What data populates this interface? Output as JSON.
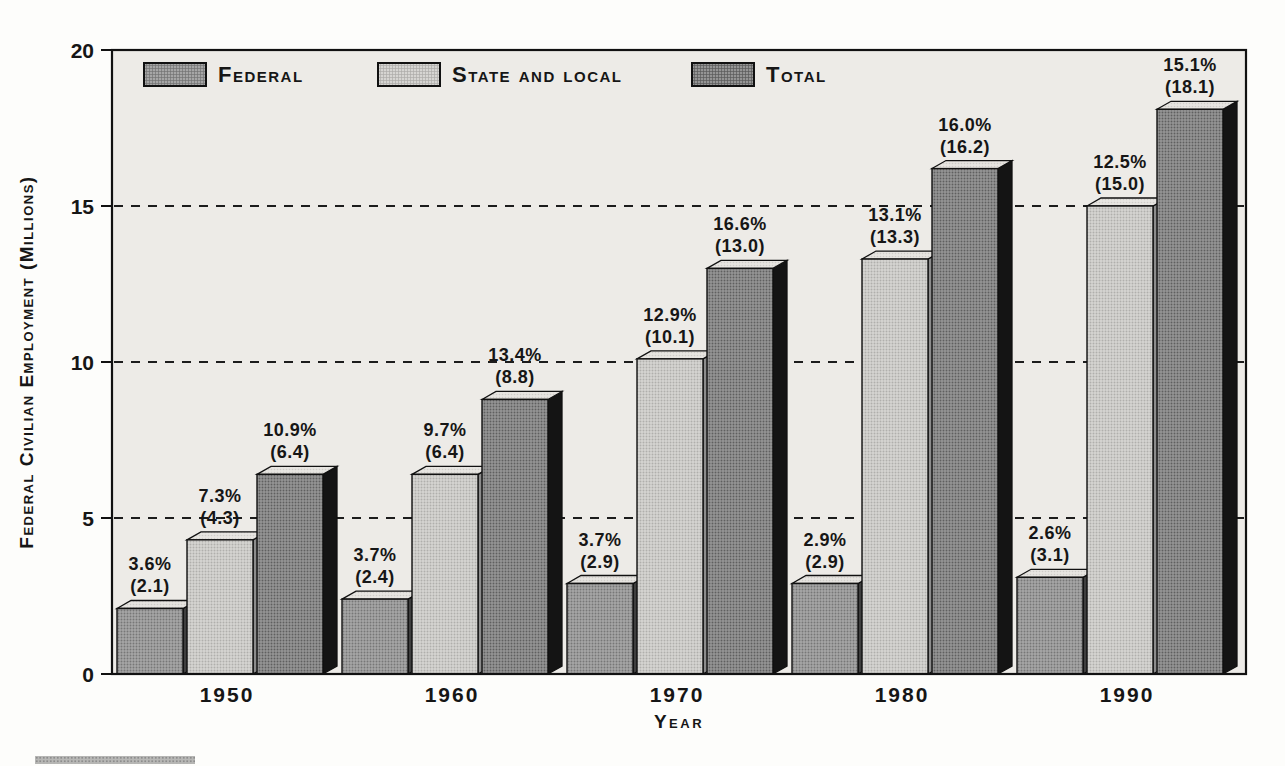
{
  "chart_data": {
    "type": "bar",
    "title": "",
    "xlabel": "Year",
    "ylabel": "Federal Civilian Employment (Millions)",
    "ylim": [
      0,
      20
    ],
    "yticks": [
      0,
      5,
      10,
      15,
      20
    ],
    "gridlines": [
      5,
      10,
      15
    ],
    "grid_style": "dashed",
    "legend_position": "top-inside",
    "categories": [
      "1950",
      "1960",
      "1970",
      "1980",
      "1990"
    ],
    "series": [
      {
        "name": "Federal",
        "values": [
          2.1,
          2.4,
          2.9,
          2.9,
          3.1
        ],
        "pct_labels": [
          "3.6%",
          "3.7%",
          "3.7%",
          "2.9%",
          "2.6%"
        ],
        "value_labels": [
          "2.1",
          "2.4",
          "2.9",
          "2.9",
          "3.1"
        ]
      },
      {
        "name": "State and local",
        "values": [
          4.3,
          6.4,
          10.1,
          13.3,
          15.0
        ],
        "pct_labels": [
          "7.3%",
          "9.7%",
          "12.9%",
          "13.1%",
          "12.5%"
        ],
        "value_labels": [
          "4.3",
          "6.4",
          "10.1",
          "13.3",
          "15.0"
        ]
      },
      {
        "name": "Total",
        "values": [
          6.4,
          8.8,
          13.0,
          16.2,
          18.1
        ],
        "pct_labels": [
          "10.9%",
          "13.4%",
          "16.6%",
          "16.0%",
          "15.1%"
        ],
        "value_labels": [
          "6.4",
          "8.8",
          "13.0",
          "16.2",
          "18.1"
        ]
      }
    ]
  },
  "colors": {
    "page_bg": "#fdfdfb",
    "plot_bg": "#edebe7",
    "outline": "#111111",
    "federal_front": "#a6a6a6",
    "state_front": "#d6d5d2",
    "total_front": "#959595",
    "bar_top_face": "#e7e5e1",
    "federal_side": "#3f3f3f",
    "state_side": "#8c8c8c",
    "total_side": "#141414",
    "grid_line": "#1c1c1c",
    "text": "#161616"
  }
}
